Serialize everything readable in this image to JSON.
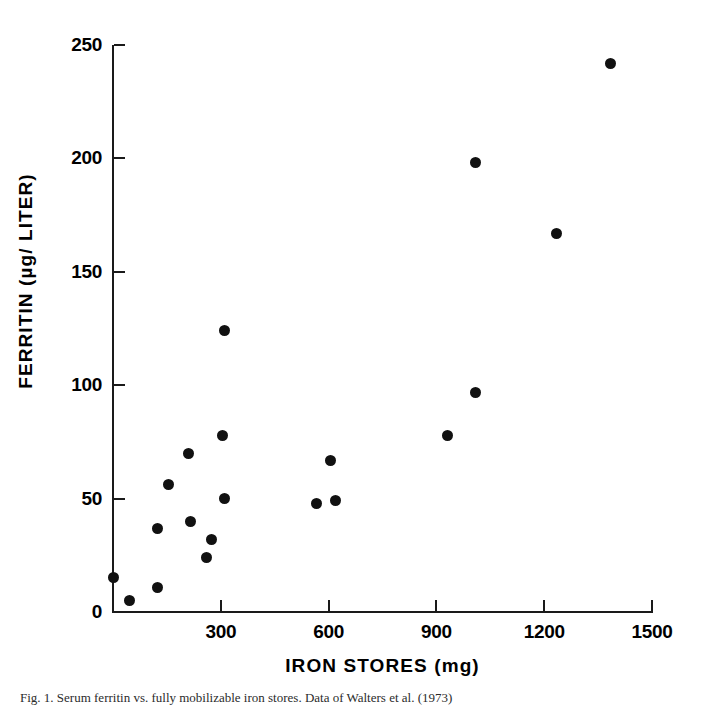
{
  "figure": {
    "caption": "Fig. 1.   Serum ferritin vs. fully mobilizable iron stores. Data of Walters et al. (1973)"
  },
  "chart_data": {
    "type": "scatter",
    "title": "",
    "xlabel": "IRON STORES (mg)",
    "ylabel": "FERRITIN (µg/ LITER)",
    "xlim": [
      0,
      1500
    ],
    "ylim": [
      0,
      250
    ],
    "xticks": [
      0,
      300,
      600,
      900,
      1200,
      1500
    ],
    "xtick_labels": [
      "",
      "300",
      "600",
      "900",
      "1200",
      "1500"
    ],
    "yticks": [
      0,
      50,
      100,
      150,
      200,
      250
    ],
    "ytick_labels": [
      "0",
      "50",
      "100",
      "150",
      "200",
      "250"
    ],
    "grid": false,
    "legend": null,
    "marker": "filled-circle",
    "marker_color": "#111111",
    "points": [
      {
        "x": 0,
        "y": 15
      },
      {
        "x": 45,
        "y": 5
      },
      {
        "x": 125,
        "y": 11
      },
      {
        "x": 125,
        "y": 37
      },
      {
        "x": 155,
        "y": 56
      },
      {
        "x": 210,
        "y": 70
      },
      {
        "x": 215,
        "y": 40
      },
      {
        "x": 260,
        "y": 24
      },
      {
        "x": 275,
        "y": 32
      },
      {
        "x": 305,
        "y": 78
      },
      {
        "x": 310,
        "y": 124
      },
      {
        "x": 310,
        "y": 50
      },
      {
        "x": 565,
        "y": 48
      },
      {
        "x": 605,
        "y": 67
      },
      {
        "x": 620,
        "y": 49
      },
      {
        "x": 930,
        "y": 78
      },
      {
        "x": 1010,
        "y": 97
      },
      {
        "x": 1010,
        "y": 198
      },
      {
        "x": 1235,
        "y": 167
      },
      {
        "x": 1385,
        "y": 242
      }
    ]
  },
  "axes": {
    "y_tick_labels": [
      "250",
      "200",
      "150",
      "100",
      "50",
      "0"
    ],
    "x_tick_labels": [
      "300",
      "600",
      "900",
      "1200",
      "1500"
    ]
  },
  "colors": {
    "axis": "#1a1a1a",
    "marker": "#111111",
    "background": "#ffffff"
  }
}
